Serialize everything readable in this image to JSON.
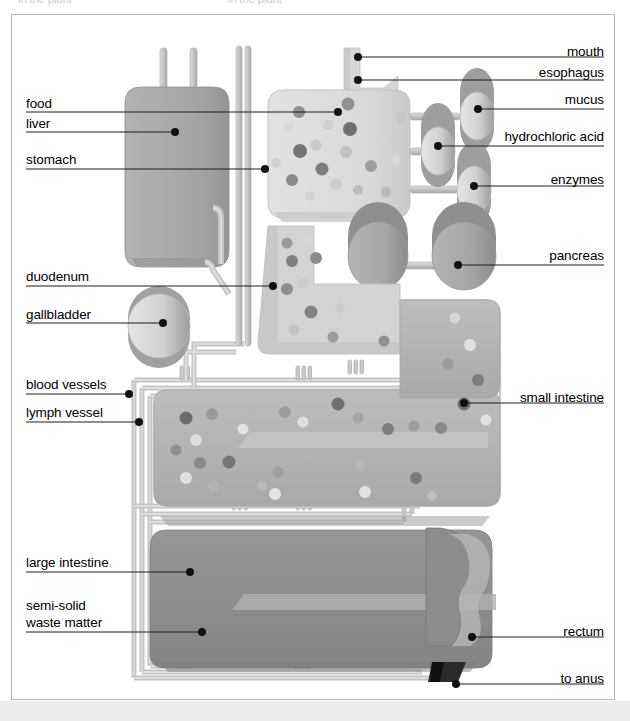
{
  "page": {
    "top_cut_text": "in the plant",
    "background": "#ffffff",
    "page_background": "#ececeb",
    "frame_color": "#b6b6b6"
  },
  "palette": {
    "liver": "#a8a8a8",
    "stomach": "#dcdcdc",
    "duodenum": "#d4d4d4",
    "small_intestine": "#b4b4b4",
    "large_intestine": "#8e8e8e",
    "pipe": "#c6c6c6",
    "pipe_shade": "#ababab",
    "cylinder": "#d8d8d8",
    "cylinder_shade": "#9e9e9e",
    "pancreas": "#a9a9a9",
    "outline_light": "#cfcfcf",
    "leader_line": "#1a1a1a",
    "dot_dark": "#6d6d6d",
    "dot_mid": "#9a9a9a",
    "dot_light": "#e8e8e8",
    "anus": "#2b2b2b"
  },
  "labels_left": [
    {
      "text": "food",
      "x": 26,
      "y": 96,
      "rule_x1": 26,
      "rule_x2": 170,
      "rule_y": 112,
      "leader_to_x": 338,
      "leader_to_y": 112,
      "dot_x": 338,
      "dot_y": 112,
      "dot": true
    },
    {
      "text": "liver",
      "x": 26,
      "y": 116,
      "rule_x1": 26,
      "rule_x2": 170,
      "rule_y": 132,
      "leader_to_x": 175,
      "leader_to_y": 132,
      "dot_x": 175,
      "dot_y": 132,
      "dot": true
    },
    {
      "text": "stomach",
      "x": 26,
      "y": 152,
      "rule_x1": 26,
      "rule_x2": 170,
      "rule_y": 169,
      "leader_to_x": 265,
      "leader_to_y": 169,
      "dot_x": 265,
      "dot_y": 169,
      "dot": true
    },
    {
      "text": "duodenum",
      "x": 26,
      "y": 269,
      "rule_x1": 26,
      "rule_x2": 170,
      "rule_y": 286,
      "leader_to_x": 273,
      "leader_to_y": 286,
      "dot_x": 273,
      "dot_y": 286,
      "dot": true
    },
    {
      "text": "gallbladder",
      "x": 26,
      "y": 307,
      "rule_x1": 26,
      "rule_x2": 170,
      "rule_y": 323,
      "leader_to_x": 163,
      "leader_to_y": 323,
      "dot_x": 163,
      "dot_y": 323,
      "dot": true
    },
    {
      "text": "blood vessels",
      "x": 26,
      "y": 377,
      "rule_x1": 26,
      "rule_x2": 170,
      "rule_y": 394,
      "leader_to_x": 129,
      "leader_to_y": 394,
      "dot_x": 129,
      "dot_y": 394,
      "dot": true
    },
    {
      "text": "lymph vessel",
      "x": 26,
      "y": 405,
      "rule_x1": 26,
      "rule_x2": 170,
      "rule_y": 422,
      "leader_to_x": 139,
      "leader_to_y": 422,
      "dot_x": 139,
      "dot_y": 422,
      "dot": true
    },
    {
      "text": "large intestine",
      "x": 26,
      "y": 555,
      "rule_x1": 26,
      "rule_x2": 170,
      "rule_y": 572,
      "leader_to_x": 190,
      "leader_to_y": 572,
      "dot_x": 190,
      "dot_y": 572,
      "dot": true
    }
  ],
  "label_multiline": {
    "line1": "semi-solid",
    "line2": "waste matter",
    "x": 26,
    "y": 598,
    "rule_x1": 26,
    "rule_x2": 170,
    "rule_y": 632,
    "dot_x": 202,
    "dot_y": 632
  },
  "labels_right": [
    {
      "text": "mouth",
      "x": 604,
      "y": 44,
      "rule_x1": 390,
      "rule_x2": 604,
      "rule_y": 61,
      "dot_x": 358,
      "dot_y": 57,
      "dot": true
    },
    {
      "text": "esophagus",
      "x": 604,
      "y": 65,
      "rule_x1": 390,
      "rule_x2": 604,
      "rule_y": 82,
      "dot_x": 358,
      "dot_y": 80,
      "dot": true
    },
    {
      "text": "mucus",
      "x": 604,
      "y": 92,
      "rule_x1": 430,
      "rule_x2": 604,
      "rule_y": 109,
      "dot_x": 478,
      "dot_y": 109,
      "dot": true
    },
    {
      "text": "hydrochloric acid",
      "x": 604,
      "y": 129,
      "rule_x1": 380,
      "rule_x2": 604,
      "rule_y": 146,
      "dot_x": 438,
      "dot_y": 146,
      "dot": true
    },
    {
      "text": "enzymes",
      "x": 604,
      "y": 172,
      "rule_x1": 430,
      "rule_x2": 604,
      "rule_y": 189,
      "dot_x": 474,
      "dot_y": 186,
      "dot": true
    },
    {
      "text": "pancreas",
      "x": 604,
      "y": 248,
      "rule_x1": 430,
      "rule_x2": 604,
      "rule_y": 265,
      "dot_x": 458,
      "dot_y": 265,
      "dot": true
    },
    {
      "text": "small intestine",
      "x": 604,
      "y": 390,
      "rule_x1": 430,
      "rule_x2": 604,
      "rule_y": 407,
      "dot_x": 464,
      "dot_y": 403,
      "dot": true
    },
    {
      "text": "rectum",
      "x": 604,
      "y": 624,
      "rule_x1": 430,
      "rule_x2": 604,
      "rule_y": 641,
      "dot_x": 472,
      "dot_y": 637,
      "dot": true
    },
    {
      "text": "to anus",
      "x": 604,
      "y": 671,
      "rule_x1": 430,
      "rule_x2": 604,
      "rule_y": 688,
      "dot_x": 456,
      "dot_y": 684,
      "dot": true
    }
  ],
  "parts": {
    "liver": "liver",
    "stomach": "stomach",
    "duodenum": "duodenum",
    "gallbladder": "gallbladder",
    "small_intestine": "small intestine",
    "large_intestine": "large intestine",
    "pancreas": "pancreas",
    "rectum": "rectum",
    "mucus_tank": "mucus",
    "acid_tank": "hydrochloric acid",
    "enzyme_tank": "enzymes",
    "mouth_chute": "mouth",
    "esophagus_chute": "esophagus",
    "blood_vessels": "blood vessels",
    "lymph_vessel": "lymph vessel",
    "anus_outlet": "to anus"
  }
}
